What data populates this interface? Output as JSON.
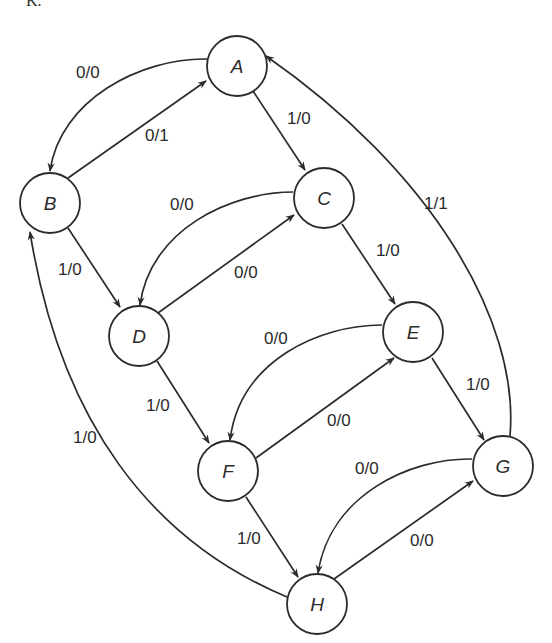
{
  "figure": {
    "corner_mark": "K.",
    "type": "state-transition-diagram"
  },
  "nodes": [
    {
      "id": "A",
      "label": "A",
      "cx": 237,
      "cy": 66
    },
    {
      "id": "B",
      "label": "B",
      "cx": 50,
      "cy": 203
    },
    {
      "id": "C",
      "label": "C",
      "cx": 324,
      "cy": 198
    },
    {
      "id": "D",
      "label": "D",
      "cx": 139,
      "cy": 336
    },
    {
      "id": "E",
      "label": "E",
      "cx": 413,
      "cy": 332
    },
    {
      "id": "F",
      "label": "F",
      "cx": 228,
      "cy": 471
    },
    {
      "id": "G",
      "label": "G",
      "cx": 503,
      "cy": 466
    },
    {
      "id": "H",
      "label": "H",
      "cx": 317,
      "cy": 604
    }
  ],
  "edges": [
    {
      "from": "A",
      "to": "B",
      "label": "0/0",
      "curved": true
    },
    {
      "from": "B",
      "to": "A",
      "label": "0/1",
      "curved": false
    },
    {
      "from": "A",
      "to": "C",
      "label": "1/0",
      "curved": false
    },
    {
      "from": "B",
      "to": "D",
      "label": "1/0",
      "curved": false
    },
    {
      "from": "C",
      "to": "D",
      "label": "0/0",
      "curved": true
    },
    {
      "from": "D",
      "to": "C",
      "label": "0/0",
      "curved": false
    },
    {
      "from": "C",
      "to": "E",
      "label": "1/0",
      "curved": false
    },
    {
      "from": "D",
      "to": "F",
      "label": "1/0",
      "curved": false
    },
    {
      "from": "E",
      "to": "F",
      "label": "0/0",
      "curved": true
    },
    {
      "from": "F",
      "to": "E",
      "label": "0/0",
      "curved": false
    },
    {
      "from": "E",
      "to": "G",
      "label": "1/0",
      "curved": false
    },
    {
      "from": "F",
      "to": "H",
      "label": "1/0",
      "curved": false
    },
    {
      "from": "G",
      "to": "H",
      "label": "0/0",
      "curved": true
    },
    {
      "from": "H",
      "to": "G",
      "label": "0/0",
      "curved": false
    },
    {
      "from": "G",
      "to": "A",
      "label": "1/1",
      "curved": true
    },
    {
      "from": "H",
      "to": "B",
      "label": "1/0",
      "curved": true
    }
  ]
}
